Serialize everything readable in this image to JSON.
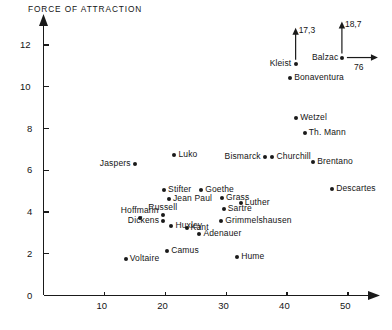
{
  "chart_data": {
    "type": "scatter",
    "title": "FORCE OF ATTRACTION",
    "xlabel": "",
    "ylabel": "FORCE OF ATTRACTION",
    "xlim": [
      0,
      54
    ],
    "ylim": [
      0,
      13
    ],
    "xticks": [
      10,
      20,
      30,
      40,
      50
    ],
    "yticks": [
      0,
      2,
      4,
      6,
      8,
      10,
      12
    ],
    "grid": false,
    "legend": null,
    "axis_arrows": {
      "x": true,
      "y": true
    },
    "points": [
      {
        "label": "Voltaire",
        "x": 13.5,
        "y": 1.75,
        "label_pos": "right"
      },
      {
        "label": "Camus",
        "x": 20.3,
        "y": 2.15,
        "label_pos": "right"
      },
      {
        "label": "Hume",
        "x": 31.8,
        "y": 1.85,
        "label_pos": "right"
      },
      {
        "label": "Adenauer",
        "x": 25.6,
        "y": 2.95,
        "label_pos": "right"
      },
      {
        "label": "Kant",
        "x": 23.5,
        "y": 3.25,
        "label_pos": "right"
      },
      {
        "label": "Huxley",
        "x": 21.0,
        "y": 3.35,
        "label_pos": "right"
      },
      {
        "label": "Dickens",
        "x": 19.6,
        "y": 3.55,
        "label_pos": "left"
      },
      {
        "label": "Russell",
        "x": 19.6,
        "y": 3.85,
        "label_pos": "above"
      },
      {
        "label": "Hoffmann",
        "x": 15.8,
        "y": 3.7,
        "label_pos": "above"
      },
      {
        "label": "Grimmelshausen",
        "x": 29.2,
        "y": 3.55,
        "label_pos": "right"
      },
      {
        "label": "Sartre",
        "x": 29.6,
        "y": 4.15,
        "label_pos": "right"
      },
      {
        "label": "Luther",
        "x": 32.4,
        "y": 4.45,
        "label_pos": "right"
      },
      {
        "label": "Grass",
        "x": 29.3,
        "y": 4.65,
        "label_pos": "right"
      },
      {
        "label": "Jean Paul",
        "x": 20.6,
        "y": 4.6,
        "label_pos": "right"
      },
      {
        "label": "Stifter",
        "x": 19.8,
        "y": 5.05,
        "label_pos": "right"
      },
      {
        "label": "Goethe",
        "x": 25.9,
        "y": 5.05,
        "label_pos": "right"
      },
      {
        "label": "Descartes",
        "x": 47.4,
        "y": 5.1,
        "label_pos": "right"
      },
      {
        "label": "Brentano",
        "x": 44.3,
        "y": 6.4,
        "label_pos": "right"
      },
      {
        "label": "Jaspers",
        "x": 15.0,
        "y": 6.3,
        "label_pos": "left"
      },
      {
        "label": "Luko",
        "x": 21.5,
        "y": 6.75,
        "label_pos": "right"
      },
      {
        "label": "Bismarck",
        "x": 36.3,
        "y": 6.65,
        "label_pos": "left"
      },
      {
        "label": "Churchill",
        "x": 37.6,
        "y": 6.65,
        "label_pos": "right"
      },
      {
        "label": "Th. Mann",
        "x": 42.9,
        "y": 7.8,
        "label_pos": "right"
      },
      {
        "label": "Wetzel",
        "x": 41.5,
        "y": 8.5,
        "label_pos": "right"
      },
      {
        "label": "Bonaventura",
        "x": 40.5,
        "y": 10.4,
        "label_pos": "right"
      },
      {
        "label": "Kleist",
        "x": 41.4,
        "y": 11.1,
        "label_pos": "left"
      },
      {
        "label": "Balzac",
        "x": 49.0,
        "y": 11.4,
        "label_pos": "left"
      }
    ],
    "annotations": [
      {
        "id": "kleist-up-arrow",
        "text": "17,3",
        "for": "Kleist",
        "direction": "up"
      },
      {
        "id": "balzac-up-arrow",
        "text": "18,7",
        "for": "Balzac",
        "direction": "up"
      },
      {
        "id": "balzac-right-arrow",
        "text": "76",
        "for": "Balzac",
        "direction": "right"
      }
    ]
  },
  "colors": {
    "axis": "#1a1a1a",
    "point": "#1a1a1a",
    "text": "#141414",
    "background": "#ffffff"
  }
}
